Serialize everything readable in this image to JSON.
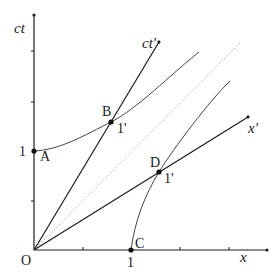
{
  "diagram": {
    "type": "minkowski-spacetime-diagram",
    "axes": {
      "ct": {
        "label": "ct",
        "ticks": 4
      },
      "x": {
        "label": "x",
        "ticks": 4
      },
      "ct_prime": {
        "label": "ct'"
      },
      "x_prime": {
        "label": "x'"
      }
    },
    "origin_label": "O",
    "light_line": {
      "style": "dotted",
      "color": "#aaaaaa"
    },
    "points": [
      {
        "id": "A",
        "label": "A",
        "tick_label": "1"
      },
      {
        "id": "B",
        "label": "B",
        "tick_label": "1'"
      },
      {
        "id": "C",
        "label": "C",
        "tick_label": "1"
      },
      {
        "id": "D",
        "label": "D",
        "tick_label": "1'"
      }
    ],
    "hyperbolas": [
      {
        "name": "timelike-calibration",
        "through": [
          "A",
          "B"
        ]
      },
      {
        "name": "spacelike-calibration",
        "through": [
          "C",
          "D"
        ]
      }
    ],
    "colors": {
      "line": "#1a1a1a",
      "curve": "#444444",
      "dotted": "#aaaaaa"
    }
  }
}
